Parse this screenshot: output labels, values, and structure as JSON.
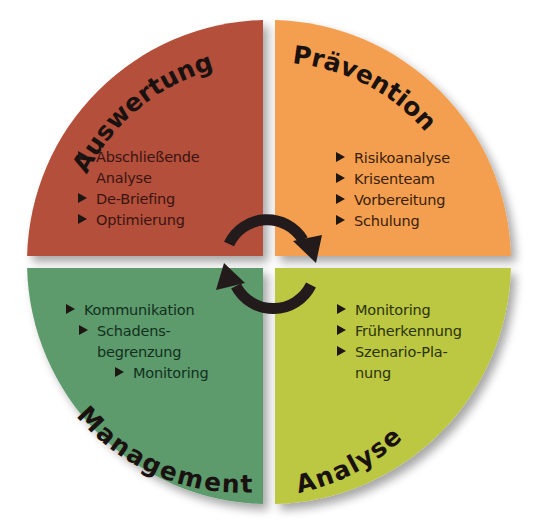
{
  "diagram": {
    "type": "cycle-quadrant",
    "center_symbol": "circular-refresh-arrows",
    "quadrants": [
      {
        "id": "auswertung",
        "position": "top-left",
        "title": "Auswertung",
        "color": "#b3503a",
        "items": [
          {
            "text": "Abschließende",
            "bullet": true
          },
          {
            "text": "Analyse",
            "bullet": false
          },
          {
            "text": "De-Briefing",
            "bullet": true
          },
          {
            "text": "Optimierung",
            "bullet": true
          }
        ]
      },
      {
        "id": "praevention",
        "position": "top-right",
        "title": "Prävention",
        "color": "#f39f4f",
        "items": [
          {
            "text": "Risikoanalyse",
            "bullet": true
          },
          {
            "text": "Krisenteam",
            "bullet": true
          },
          {
            "text": "Vorbereitung",
            "bullet": true
          },
          {
            "text": "Schulung",
            "bullet": true
          }
        ]
      },
      {
        "id": "management",
        "position": "bottom-left",
        "title": "Management",
        "color": "#5d9a6c",
        "items": [
          {
            "text": "Kommunikation",
            "bullet": true
          },
          {
            "text": "Schadens-",
            "bullet": true
          },
          {
            "text": "begrenzung",
            "bullet": false
          },
          {
            "text": "Monitoring",
            "bullet": true
          }
        ]
      },
      {
        "id": "analyse",
        "position": "bottom-right",
        "title": "Analyse",
        "color": "#bcc743",
        "items": [
          {
            "text": "Monitoring",
            "bullet": true
          },
          {
            "text": "Früherkennung",
            "bullet": true
          },
          {
            "text": "Szenario-Pla-",
            "bullet": true
          },
          {
            "text": "nung",
            "bullet": false
          }
        ]
      }
    ],
    "arrow_color": "#231a1c",
    "divider_color": "#ffffff"
  }
}
